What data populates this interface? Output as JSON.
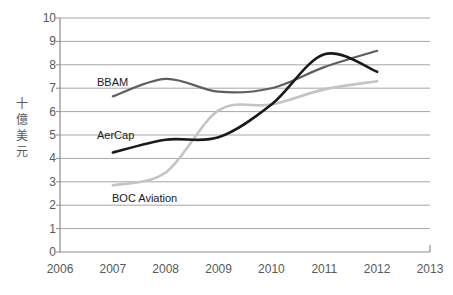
{
  "chart_data": {
    "type": "line",
    "title": "",
    "xlabel": "",
    "ylabel": "十億美元",
    "ylabel_chars": [
      "十",
      "億",
      "美",
      "元"
    ],
    "xlim": [
      2006,
      2013
    ],
    "ylim": [
      0,
      10
    ],
    "grid": true,
    "legend_position": "inline-labels",
    "x_ticks": [
      "2006",
      "2007",
      "2008",
      "2009",
      "2010",
      "2011",
      "2012",
      "2013"
    ],
    "y_ticks": [
      "0",
      "1",
      "2",
      "3",
      "4",
      "5",
      "6",
      "7",
      "8",
      "9",
      "10"
    ],
    "x": [
      2007,
      2008,
      2009,
      2010,
      2011,
      2012
    ],
    "series": [
      {
        "name": "BBAM",
        "color": "#5e5e5e",
        "values": [
          6.65,
          7.4,
          6.85,
          7.0,
          7.9,
          8.6
        ],
        "label_x": 97,
        "label_y": 76
      },
      {
        "name": "AerCap",
        "color": "#1a1a1a",
        "values": [
          4.25,
          4.8,
          4.9,
          6.3,
          8.45,
          7.7
        ],
        "label_x": 97,
        "label_y": 129
      },
      {
        "name": "BOC Aviation",
        "color": "#c4c4c4",
        "values": [
          2.85,
          3.4,
          6.05,
          6.3,
          6.95,
          7.3
        ],
        "label_x": 112,
        "label_y": 192
      }
    ]
  },
  "axes": {
    "vertical_label": "十億美元",
    "vertical_label_chars": [
      "十",
      "億",
      "美",
      "元"
    ]
  },
  "style": {
    "background": "#ffffff",
    "gridline_color": "#a6a6a6",
    "axis_color": "#808080",
    "tick_text_color": "#595959"
  }
}
